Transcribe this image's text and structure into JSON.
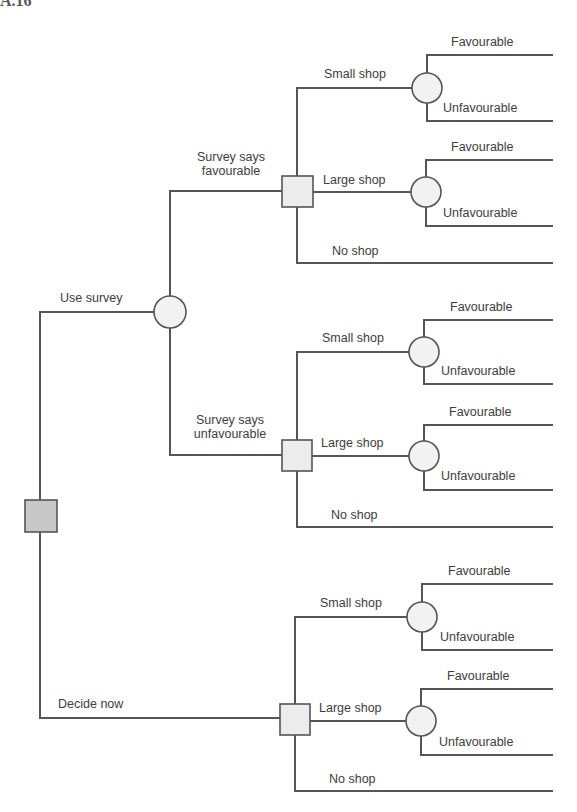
{
  "title_fragment": "A.16",
  "colors": {
    "line": "#555555",
    "text": "#3d3d3d",
    "root_fill": "#c8c8c8",
    "decision_fill": "#ececec",
    "chance_fill": "#f2f2f2"
  },
  "root": {
    "label": "Decision",
    "branches": [
      "Use survey",
      "Decide now"
    ]
  },
  "survey_node": {
    "branches": [
      "Survey says favourable",
      "Survey says unfavourable"
    ]
  },
  "labels": {
    "use_survey": "Use survey",
    "decide_now": "Decide now",
    "survey_fav_1": "Survey says",
    "survey_fav_2": "favourable",
    "survey_unfav_1": "Survey says",
    "survey_unfav_2": "unfavourable"
  },
  "groups": [
    {
      "small": "Small shop",
      "large": "Large shop",
      "none": "No shop",
      "fav": "Favourable",
      "unfav": "Unfavourable"
    },
    {
      "small": "Small shop",
      "large": "Large shop",
      "none": "No shop",
      "fav": "Favourable",
      "unfav": "Unfavourable"
    },
    {
      "small": "Small shop",
      "large": "Large shop",
      "none": "No shop",
      "fav": "Favourable",
      "unfav": "Unfavourable"
    }
  ]
}
